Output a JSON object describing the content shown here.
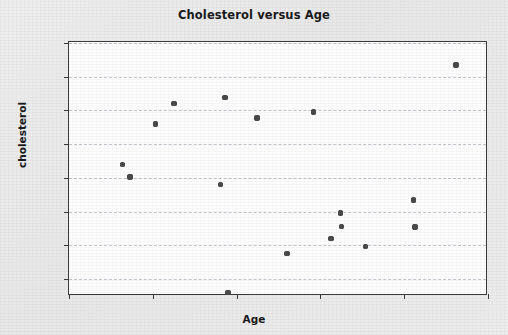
{
  "chart_data": {
    "type": "scatter",
    "title": "Cholesterol versus Age",
    "xlabel": "Age",
    "ylabel": "cholesterol",
    "xlim": [
      20,
      70
    ],
    "ylim": [
      28,
      65
    ],
    "xticks": [
      20,
      30,
      40,
      50,
      60,
      70
    ],
    "yticks": [
      30,
      35,
      40,
      45,
      50,
      55,
      60,
      65
    ],
    "grid": "horizontal-dashed",
    "legend": "none",
    "marker_color": "#4a4a4a",
    "series": [
      {
        "name": "cholesterol",
        "points": [
          {
            "x": 26.4,
            "y": 47.0
          },
          {
            "x": 27.3,
            "y": 45.1
          },
          {
            "x": 30.3,
            "y": 53.0
          },
          {
            "x": 32.5,
            "y": 56.0
          },
          {
            "x": 38.1,
            "y": 44.0
          },
          {
            "x": 38.6,
            "y": 56.9
          },
          {
            "x": 39.0,
            "y": 28.0
          },
          {
            "x": 42.4,
            "y": 53.9
          },
          {
            "x": 46.0,
            "y": 33.8
          },
          {
            "x": 49.2,
            "y": 54.8
          },
          {
            "x": 51.3,
            "y": 36.0
          },
          {
            "x": 52.4,
            "y": 39.8
          },
          {
            "x": 52.5,
            "y": 37.8
          },
          {
            "x": 55.4,
            "y": 34.8
          },
          {
            "x": 61.1,
            "y": 41.7
          },
          {
            "x": 61.3,
            "y": 37.7
          },
          {
            "x": 66.2,
            "y": 61.7
          }
        ]
      }
    ]
  },
  "figure": {
    "background_color": "#ebebeb",
    "plot_background_color": "#fdfdfd",
    "frame_color": "#3a3a3a",
    "grid_color": "#b9b9c4"
  }
}
